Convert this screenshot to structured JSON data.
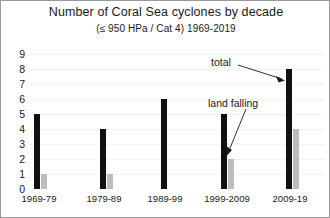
{
  "chart_data": {
    "type": "bar",
    "title": "Number of Coral Sea cyclones by decade",
    "subtitle": "(≤ 950 HPa / Cat 4)  1969-2019",
    "xlabel": "",
    "ylabel": "",
    "ylim": [
      0,
      9
    ],
    "grid": false,
    "legend_position": "none",
    "categories": [
      "1969-79",
      "1979-89",
      "1989-99",
      "1999-2009",
      "2009-19"
    ],
    "yticks": [
      "9",
      "8",
      "7",
      "6",
      "5",
      "4",
      "3",
      "2",
      "1",
      "0"
    ],
    "series": [
      {
        "name": "total",
        "color": "#111111",
        "values": [
          5,
          4,
          6,
          5,
          8
        ]
      },
      {
        "name": "land falling",
        "color": "#bdbdbd",
        "values": [
          1,
          1,
          0,
          2,
          4
        ]
      }
    ],
    "annotations": [
      {
        "text": "total",
        "target": "2009-19 total bar"
      },
      {
        "text": "land falling",
        "target": "1999-2009 land falling bar"
      }
    ]
  }
}
